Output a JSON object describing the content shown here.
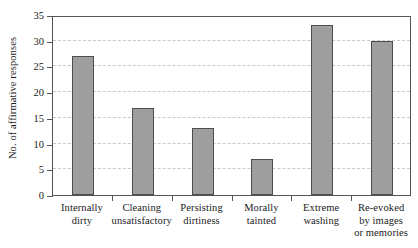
{
  "chart_data": {
    "type": "bar",
    "title": "",
    "subtitle": "",
    "xlabel": "",
    "ylabel": "No. of affirmative responses",
    "categories": [
      "Internally dirty",
      "Cleaning unsatisfactory",
      "Persisting dirtiness",
      "Morally tainted",
      "Extreme washing",
      "Re-evoked by images or memories"
    ],
    "category_lines": [
      [
        "Internally",
        "dirty"
      ],
      [
        "Cleaning",
        "unsatisfactory"
      ],
      [
        "Persisting",
        "dirtiness"
      ],
      [
        "Morally",
        "tainted"
      ],
      [
        "Extreme",
        "washing"
      ],
      [
        "Re-evoked",
        "by images",
        "or memories"
      ]
    ],
    "values": [
      27,
      17,
      13,
      7,
      33,
      30
    ],
    "ylim": [
      0,
      35
    ],
    "ytick_step": 5,
    "yticks": [
      0,
      5,
      10,
      15,
      20,
      25,
      30,
      35
    ],
    "ytick_labels": [
      "0",
      "5",
      "10",
      "15",
      "20",
      "25",
      "30",
      "35"
    ],
    "grid": true,
    "grid_axis": "y",
    "grid_style": "dashed",
    "legend": false,
    "legend_position": "none",
    "colors": {
      "bar_fill": "#9e9e9e",
      "bar_edge": "#4d4d4d",
      "axis": "#555555",
      "grid": "#c9c9c9",
      "background": "#ffffff",
      "text": "#1a1a1a"
    }
  }
}
